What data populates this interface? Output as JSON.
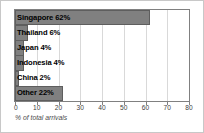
{
  "chart_data": {
    "type": "bar",
    "orientation": "horizontal",
    "title": "",
    "xlabel": "% of total arrivals",
    "ylabel": "",
    "xlim": [
      0,
      80
    ],
    "xticks": [
      0,
      10,
      20,
      30,
      40,
      50,
      60,
      70,
      80
    ],
    "grid": true,
    "legend": false,
    "categories": [
      "Singapore",
      "Thailand",
      "Japan",
      "Indonesia",
      "China",
      "Other"
    ],
    "values": [
      62,
      6,
      4,
      4,
      2,
      22
    ],
    "bar_labels": [
      "Singapore 62%",
      "Thailand 6%",
      "Japan 4%",
      "Indonesia 4%",
      "China 2%",
      "Other 22%"
    ],
    "colors": {
      "bar_fill": "#808080",
      "bar_edge": "#5e5e5e",
      "plot_background": "#ffffff",
      "gridline": "#d9d9d9",
      "axis": "#808080",
      "label_text": "#000000",
      "tick_text": "#3d3d3d",
      "caption_text": "#4a4a4a",
      "figure_border": "#c8c8c8"
    }
  }
}
